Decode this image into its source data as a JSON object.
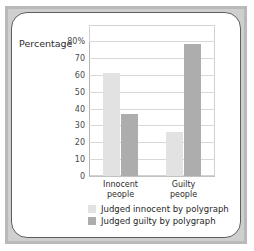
{
  "chart_data": {
    "type": "bar",
    "title": "",
    "xlabel": "",
    "ylabel": "Percentage",
    "ylim": [
      0,
      80
    ],
    "grid": true,
    "legend_position": "bottom",
    "categories": [
      "Innocent\npeople",
      "Guilty\npeople"
    ],
    "category_lines": [
      [
        "Innocent",
        "people"
      ],
      [
        "Guilty",
        "people"
      ]
    ],
    "tick_labels": [
      "80%",
      "70",
      "60",
      "50",
      "40",
      "30",
      "20",
      "10",
      "0"
    ],
    "tick_values": [
      80,
      70,
      60,
      50,
      40,
      30,
      20,
      10,
      0
    ],
    "series": [
      {
        "name": "Judged innocent by polygraph",
        "color": "#e2e2e2",
        "values": [
          61,
          26
        ]
      },
      {
        "name": "Judged guilty by polygraph",
        "color": "#adadad",
        "values": [
          37,
          78
        ]
      }
    ]
  },
  "legend": [
    {
      "label": "Judged innocent by polygraph",
      "swatch": "light"
    },
    {
      "label": "Judged guilty by polygraph",
      "swatch": "dark"
    }
  ],
  "colors": {
    "bar_light": "#e2e2e2",
    "bar_dark": "#adadad",
    "grid": "#d8d8d8",
    "frame": "#5e5e5e",
    "mat": "#cfcfcf"
  }
}
